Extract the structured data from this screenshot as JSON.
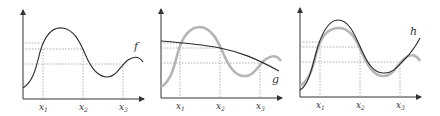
{
  "figure": {
    "panels": [
      {
        "id": "panel-f",
        "function_label": "f",
        "ticks": [
          "x",
          "x",
          "x"
        ],
        "tick_subscripts": [
          "1",
          "2",
          "3"
        ]
      },
      {
        "id": "panel-g",
        "function_label": "g",
        "ticks": [
          "x",
          "x",
          "x"
        ],
        "tick_subscripts": [
          "1",
          "2",
          "3"
        ]
      },
      {
        "id": "panel-h",
        "function_label": "h",
        "ticks": [
          "x",
          "x",
          "x"
        ],
        "tick_subscripts": [
          "1",
          "2",
          "3"
        ]
      }
    ],
    "colors": {
      "axis": "#333333",
      "dark_curve": "#2a2a2a",
      "grey_curve": "#b5b5b5",
      "guide": "#999999"
    }
  }
}
